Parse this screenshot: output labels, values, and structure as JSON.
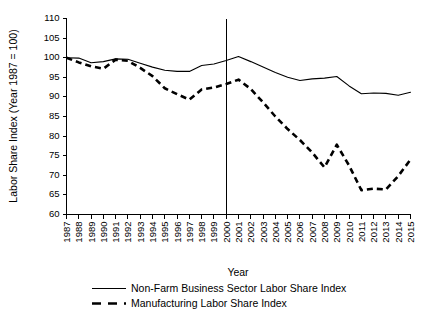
{
  "chart_data": {
    "type": "line",
    "title": "",
    "xlabel": "Year",
    "ylabel": "Labor Share Index (Year 1987 = 100)",
    "xlim": [
      1987,
      2015
    ],
    "ylim": [
      60,
      110
    ],
    "yticks": [
      60,
      65,
      70,
      75,
      80,
      85,
      90,
      95,
      100,
      105,
      110
    ],
    "grid": false,
    "legend_position": "bottom",
    "x": [
      1987,
      1988,
      1989,
      1990,
      1991,
      1992,
      1993,
      1994,
      1995,
      1996,
      1997,
      1998,
      1999,
      2000,
      2001,
      2002,
      2003,
      2004,
      2005,
      2006,
      2007,
      2008,
      2009,
      2010,
      2011,
      2012,
      2013,
      2014,
      2015
    ],
    "categories": [
      "1987",
      "1988",
      "1989",
      "1990",
      "1991",
      "1992",
      "1993",
      "1994",
      "1995",
      "1996",
      "1997",
      "1998",
      "1999",
      "2000",
      "2001",
      "2002",
      "2003",
      "2004",
      "2005",
      "2006",
      "2007",
      "2008",
      "2009",
      "2010",
      "2011",
      "2012",
      "2013",
      "2014",
      "2015"
    ],
    "series": [
      {
        "name": "Non-Farm Business Sector Labor Share Index",
        "style": "solid",
        "color": "#000000",
        "values": [
          100.0,
          99.9,
          98.7,
          99.0,
          99.7,
          99.6,
          98.6,
          97.6,
          96.8,
          96.5,
          96.5,
          98.0,
          98.4,
          99.3,
          100.3,
          99.0,
          97.6,
          96.2,
          95.0,
          94.2,
          94.6,
          94.8,
          95.2,
          92.8,
          90.8,
          91.0,
          90.9,
          90.4,
          91.2
        ]
      },
      {
        "name": "Manufacturing Labor Share Index",
        "style": "dashed",
        "color": "#000000",
        "values": [
          100.0,
          98.8,
          97.8,
          97.2,
          99.5,
          99.2,
          97.4,
          95.3,
          92.2,
          90.7,
          89.3,
          91.9,
          92.4,
          93.3,
          94.4,
          92.0,
          88.6,
          85.0,
          81.8,
          79.0,
          75.8,
          72.0,
          77.8,
          72.5,
          66.2,
          66.6,
          66.4,
          69.8,
          74.0
        ]
      }
    ],
    "annotations": [
      {
        "type": "vertical-line",
        "x": 2000,
        "label": ""
      }
    ],
    "legend_entries": [
      {
        "label": "Non-Farm Business Sector Labor Share Index",
        "style": "solid"
      },
      {
        "label": "Manufacturing Labor Share Index",
        "style": "dashed"
      }
    ]
  }
}
